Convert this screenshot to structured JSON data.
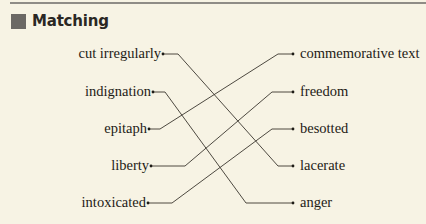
{
  "section": {
    "title": "Matching",
    "marker_color": "#6b6864"
  },
  "left_items": [
    {
      "label": "cut irregularly",
      "y": 54,
      "dot_x": 163
    },
    {
      "label": "indignation",
      "y": 92,
      "dot_x": 153
    },
    {
      "label": "epitaph",
      "y": 129,
      "dot_x": 149
    },
    {
      "label": "liberty",
      "y": 166,
      "dot_x": 151
    },
    {
      "label": "intoxicated",
      "y": 203,
      "dot_x": 148
    }
  ],
  "right_items": [
    {
      "label": "commemorative text",
      "y": 54
    },
    {
      "label": "freedom",
      "y": 92
    },
    {
      "label": "besotted",
      "y": 129
    },
    {
      "label": "lacerate",
      "y": 166
    },
    {
      "label": "anger",
      "y": 203
    }
  ],
  "matches": [
    {
      "left": "cut irregularly",
      "right": "lacerate"
    },
    {
      "left": "indignation",
      "right": "anger"
    },
    {
      "left": "epitaph",
      "right": "commemorative text"
    },
    {
      "left": "liberty",
      "right": "freedom"
    },
    {
      "left": "intoxicated",
      "right": "besotted"
    }
  ]
}
